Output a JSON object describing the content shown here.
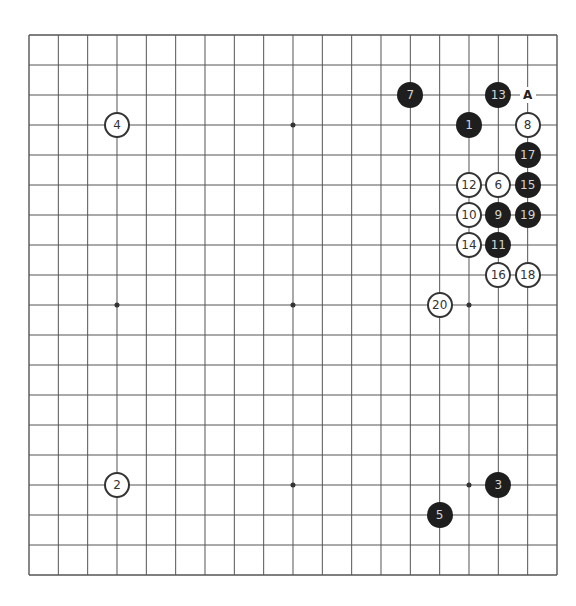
{
  "board": {
    "size": 19,
    "origin_x": 29,
    "origin_y": 35,
    "spacing_x": 29.333,
    "spacing_y": 30,
    "line_color": "#555555",
    "background": "#ffffff",
    "coordinates_shown": false
  },
  "star_points": [
    [
      3,
      3
    ],
    [
      9,
      3
    ],
    [
      15,
      3
    ],
    [
      3,
      9
    ],
    [
      9,
      9
    ],
    [
      15,
      9
    ],
    [
      3,
      15
    ],
    [
      9,
      15
    ],
    [
      15,
      15
    ]
  ],
  "stones": [
    {
      "move": "1",
      "color": "black",
      "col": 15,
      "row": 3
    },
    {
      "move": "2",
      "color": "white",
      "col": 3,
      "row": 15
    },
    {
      "move": "3",
      "color": "black",
      "col": 16,
      "row": 15
    },
    {
      "move": "4",
      "color": "white",
      "col": 3,
      "row": 3
    },
    {
      "move": "5",
      "color": "black",
      "col": 14,
      "row": 16
    },
    {
      "move": "6",
      "color": "white",
      "col": 16,
      "row": 5
    },
    {
      "move": "7",
      "color": "black",
      "col": 13,
      "row": 2
    },
    {
      "move": "8",
      "color": "white",
      "col": 17,
      "row": 3
    },
    {
      "move": "9",
      "color": "black",
      "col": 16,
      "row": 6
    },
    {
      "move": "10",
      "color": "white",
      "col": 15,
      "row": 6
    },
    {
      "move": "11",
      "color": "black",
      "col": 16,
      "row": 7
    },
    {
      "move": "12",
      "color": "white",
      "col": 15,
      "row": 5
    },
    {
      "move": "13",
      "color": "black",
      "col": 16,
      "row": 2
    },
    {
      "move": "14",
      "color": "white",
      "col": 15,
      "row": 7
    },
    {
      "move": "15",
      "color": "black",
      "col": 17,
      "row": 5
    },
    {
      "move": "16",
      "color": "white",
      "col": 16,
      "row": 8
    },
    {
      "move": "17",
      "color": "black",
      "col": 17,
      "row": 4
    },
    {
      "move": "18",
      "color": "white",
      "col": 17,
      "row": 8
    },
    {
      "move": "19",
      "color": "black",
      "col": 17,
      "row": 6
    },
    {
      "move": "20",
      "color": "white",
      "col": 14,
      "row": 9
    }
  ],
  "labels": [
    {
      "text": "A",
      "col": 17,
      "row": 2
    }
  ],
  "colors": {
    "black_stone": "#1e1e1e",
    "black_text": "#d4d4d4",
    "white_stone": "#ffffff",
    "white_border": "#333333",
    "white_text": "#333333"
  }
}
